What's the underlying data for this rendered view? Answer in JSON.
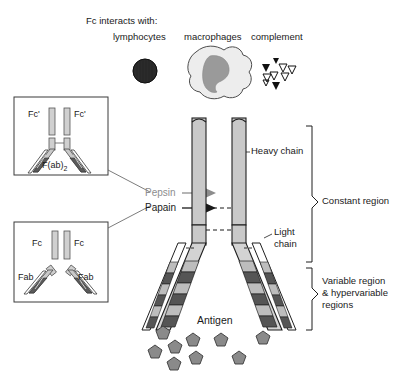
{
  "figure": {
    "background_color": "#ffffff"
  },
  "header": {
    "intro": "Fc interacts with:",
    "columns": [
      {
        "label": "lymphocytes",
        "icon": "lymphocyte-icon"
      },
      {
        "label": "macrophages",
        "icon": "macrophage-icon"
      },
      {
        "label": "complement",
        "icon": "complement-triangles-icon"
      }
    ]
  },
  "insets": [
    {
      "id": "fab2",
      "labels": [
        "Fc'",
        "Fc'"
      ],
      "fragment_label": "F(ab)",
      "fragment_sub": "2",
      "connects_to": "pepsin"
    },
    {
      "id": "fab",
      "labels": [
        "Fc",
        "Fc"
      ],
      "arm_labels": [
        "Fab",
        "Fab"
      ],
      "connects_to": "papain"
    }
  ],
  "enzymes": [
    {
      "name": "Pepsin",
      "color": "#8d8d8d"
    },
    {
      "name": "Papain",
      "color": "#1a1a1a"
    }
  ],
  "annotations": {
    "heavy_chain": "Heavy chain",
    "light_chain_line1": "Light",
    "light_chain_line2": "chain",
    "constant_region": "Constant region",
    "variable_region_line1": "Variable region",
    "variable_region_line2": "& hypervariable",
    "variable_region_line3": "regions",
    "antigen": "Antigen"
  },
  "colors": {
    "outline": "#1a1a1a",
    "heavy_chain_fill": "#c9c9c9",
    "heavy_chain_fill_light": "#d8d8d8",
    "hypervariable_dark": "#4a4a4a",
    "hypervariable_mid": "#6e6e6e",
    "hypervariable_light": "#bdbdbd",
    "light_chain_fill": "#ffffff",
    "antigen_fill": "#8a8a8a",
    "lymphocyte_fill": "#2b2b2b",
    "macrophage_cyto": "#ededed",
    "macrophage_nucleus": "#9a9a9a",
    "pepsin_gray": "#8d8d8d",
    "box_border": "#3a3a3a"
  }
}
